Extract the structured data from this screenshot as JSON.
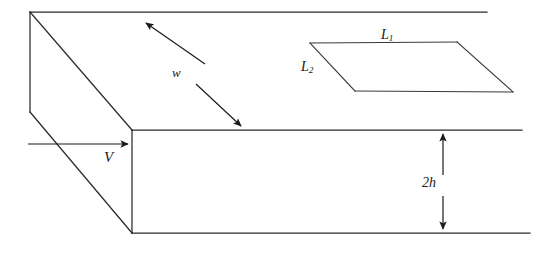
{
  "figure": {
    "type": "engineering-schematic",
    "background_color": "#ffffff",
    "line_color": "#2b2b2b",
    "width_px": 548,
    "height_px": 253
  },
  "labels": {
    "width_symbol": "w",
    "velocity_symbol": "V",
    "height_symbol_prefix": "2",
    "height_symbol_base": "h",
    "patch_length_1_base": "L",
    "patch_length_1_sub": "1",
    "patch_length_2_base": "L",
    "patch_length_2_sub": "2"
  },
  "geometry": {
    "channel": {
      "top_back_edge": [
        [
          30,
          12
        ],
        [
          487,
          12
        ]
      ],
      "left_back_vertical": [
        [
          30,
          12
        ],
        [
          30,
          112
        ]
      ],
      "top_left_diagonal": [
        [
          30,
          12
        ],
        [
          132,
          130
        ]
      ],
      "left_lower_diagonal": [
        [
          30,
          112
        ],
        [
          132,
          233
        ]
      ],
      "front_top_edge": [
        [
          132,
          130
        ],
        [
          522,
          130
        ]
      ],
      "front_vertical_edge": [
        [
          132,
          130
        ],
        [
          132,
          233
        ]
      ],
      "bottom_front_edge": [
        [
          132,
          233
        ],
        [
          530,
          233
        ]
      ]
    },
    "patch": {
      "top_left": [
        310,
        43
      ],
      "top_right": [
        457,
        42
      ],
      "bottom_right": [
        513,
        92
      ],
      "bottom_left": [
        355,
        91
      ]
    },
    "width_arrow": {
      "start": [
        143,
        20
      ],
      "end": [
        243,
        128
      ],
      "double_headed": true,
      "gap_for_label": true
    },
    "velocity_arrow": {
      "start": [
        28,
        144
      ],
      "end": [
        131,
        144
      ],
      "double_headed": false
    },
    "height_arrow": {
      "x": 443,
      "top": 131,
      "bottom": 232,
      "double_headed": true
    }
  }
}
